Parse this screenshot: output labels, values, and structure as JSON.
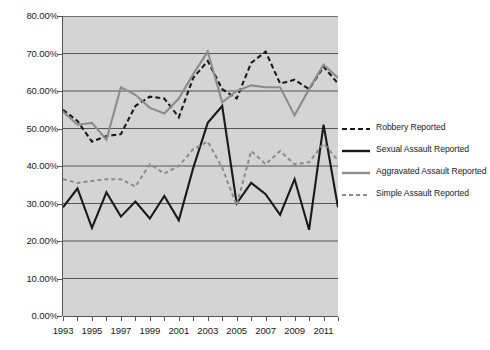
{
  "chart_data": {
    "type": "line",
    "title": "",
    "xlabel": "",
    "ylabel": "",
    "ylim": [
      0,
      80
    ],
    "xlim": [
      1993,
      2012
    ],
    "grid": true,
    "grid_axis": "y",
    "legend_position": "right",
    "plot_background": "#d4d4d4",
    "y_tick_labels": [
      "80.00%",
      "70.00%",
      "60.00%",
      "50.00%",
      "40.00%",
      "30.00%",
      "20.00%",
      "10.00%",
      "0.00%"
    ],
    "y_tick_values": [
      80,
      70,
      60,
      50,
      40,
      30,
      20,
      10,
      0
    ],
    "x": [
      1993,
      1994,
      1995,
      1996,
      1997,
      1998,
      1999,
      2000,
      2001,
      2002,
      2003,
      2004,
      2005,
      2006,
      2007,
      2008,
      2009,
      2010,
      2011,
      2012
    ],
    "x_tick_labels": [
      "1993",
      "",
      "1995",
      "",
      "1997",
      "",
      "1999",
      "",
      "2001",
      "",
      "2003",
      "",
      "2005",
      "",
      "2007",
      "",
      "2009",
      "",
      "2011",
      ""
    ],
    "series": [
      {
        "name": "Robbery Reported",
        "color": "#1a1a1a",
        "style": "dashed",
        "width": 2.1,
        "dash": "5,3",
        "values": [
          55.0,
          52.0,
          46.5,
          48.0,
          48.5,
          56.0,
          58.5,
          58.0,
          53.0,
          63.5,
          68.0,
          60.5,
          58.0,
          67.5,
          70.5,
          62.0,
          63.0,
          60.5,
          66.5,
          62.0
        ]
      },
      {
        "name": "Sexual Assault Reported",
        "color": "#1a1a1a",
        "style": "solid",
        "width": 2.1,
        "dash": "",
        "values": [
          29.0,
          34.0,
          23.5,
          33.0,
          26.5,
          30.5,
          26.0,
          32.0,
          25.5,
          39.5,
          51.5,
          56.0,
          30.0,
          35.5,
          32.5,
          27.0,
          36.5,
          23.0,
          51.0,
          29.0
        ]
      },
      {
        "name": "Aggravated Assault Reported",
        "color": "#8c8c8c",
        "style": "solid",
        "width": 2.1,
        "dash": "",
        "values": [
          54.5,
          51.0,
          51.5,
          47.0,
          61.0,
          59.0,
          55.5,
          54.0,
          58.0,
          64.5,
          70.5,
          57.0,
          60.0,
          61.5,
          61.0,
          61.0,
          53.5,
          60.5,
          67.0,
          63.5
        ]
      },
      {
        "name": "Simple Assault Reported",
        "color": "#8c8c8c",
        "style": "dashed",
        "width": 2.0,
        "dash": "4,3",
        "values": [
          36.5,
          35.5,
          36.0,
          36.5,
          36.5,
          34.5,
          40.5,
          38.0,
          40.0,
          44.5,
          46.5,
          39.5,
          29.5,
          44.0,
          40.5,
          44.0,
          40.5,
          41.0,
          46.0,
          41.5
        ]
      }
    ]
  },
  "legend": {
    "items": [
      {
        "label": "Robbery Reported"
      },
      {
        "label": "Sexual Assault Reported"
      },
      {
        "label": "Aggravated Assault Reported"
      },
      {
        "label": "Simple Assault Reported"
      }
    ]
  }
}
